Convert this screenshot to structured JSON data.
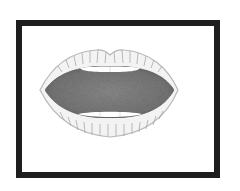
{
  "image": {
    "subject": "open-mouth illustration",
    "style": "grayscale stippled clip-art",
    "frame_color": "#1e1e1e",
    "background_color": "#ffffff",
    "colors": {
      "lip_light": "#f2f2f2",
      "lip_line": "#9a9a9a",
      "lip_outline": "#b5b5b5",
      "cavity": "#7a7a7a",
      "cavity_dark": "#5c5c5c",
      "teeth": "#ffffff"
    }
  }
}
